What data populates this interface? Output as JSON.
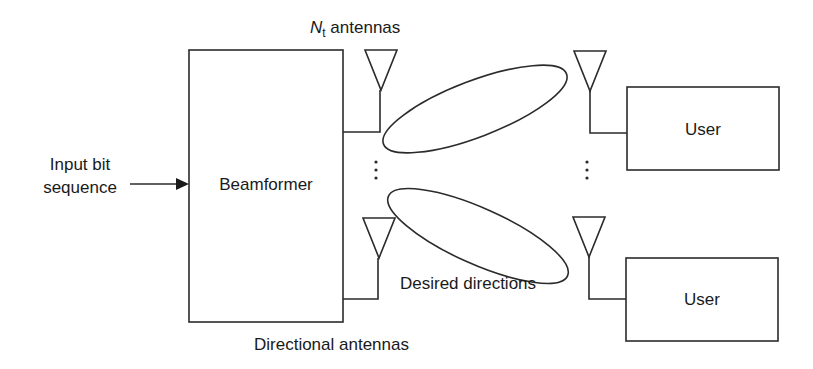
{
  "diagram": {
    "title_label": {
      "main": "N",
      "sub": "t",
      "rest": " antennas"
    },
    "input_label_line1": "Input bit",
    "input_label_line2": "sequence",
    "beamformer_label": "Beamformer",
    "directional_label": "Directional antennas",
    "desired_label": "Desired directions",
    "users": [
      {
        "label": "User"
      },
      {
        "label": "User"
      }
    ],
    "ellipsis": "⋮"
  }
}
